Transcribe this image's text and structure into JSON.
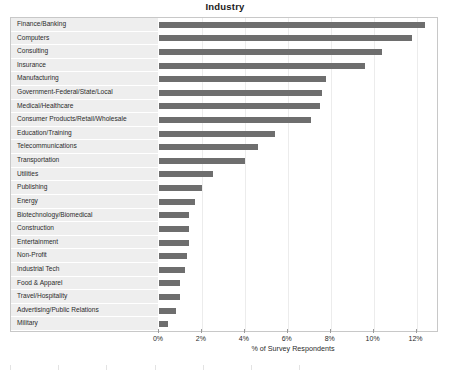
{
  "chart_data": {
    "type": "bar",
    "orientation": "horizontal",
    "title": "Industry",
    "xlabel": "% of Survey Respondents",
    "ylabel": "",
    "xlim": [
      0,
      13
    ],
    "xticks": [
      0,
      2,
      4,
      6,
      8,
      10,
      12
    ],
    "xtick_labels": [
      "0%",
      "2%",
      "4%",
      "6%",
      "8%",
      "10%",
      "12%"
    ],
    "grid": true,
    "grid_axis": "x",
    "legend": false,
    "bar_color": "#6e6e6e",
    "row_band_color": "#eeeeee",
    "categories": [
      "Finance/Banking",
      "Computers",
      "Consulting",
      "Insurance",
      "Manufacturing",
      "Government-Federal/State/Local",
      "Medical/Healthcare",
      "Consumer Products/Retail/Wholesale",
      "Education/Training",
      "Telecommunications",
      "Transportation",
      "Utilities",
      "Publishing",
      "Energy",
      "Biotechnology/Biomedical",
      "Construction",
      "Entertainment",
      "Non-Profit",
      "Industrial Tech",
      "Food & Apparel",
      "Travel/Hospitality",
      "Advertising/Public Relations",
      "Military"
    ],
    "values": [
      12.4,
      11.8,
      10.4,
      9.6,
      7.8,
      7.6,
      7.5,
      7.1,
      5.4,
      4.6,
      4.0,
      2.5,
      2.0,
      1.7,
      1.4,
      1.4,
      1.4,
      1.3,
      1.2,
      1.0,
      1.0,
      0.8,
      0.4
    ]
  }
}
